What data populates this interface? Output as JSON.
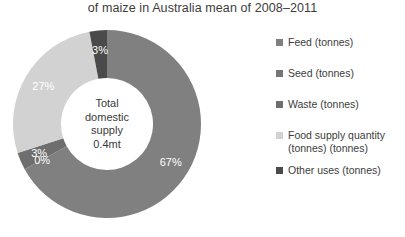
{
  "chart_data": {
    "type": "pie",
    "variant": "donut",
    "title": "of maize in Australia mean of 2008–2011",
    "categories": [
      "Feed (tonnes)",
      "Seed (tonnes)",
      "Waste (tonnes)",
      "Food supply quantity (tonnes) (tonnes)",
      "Other uses (tonnes)"
    ],
    "values": [
      67,
      0,
      3,
      27,
      3
    ],
    "data_labels": [
      "67%",
      "0%",
      "3%",
      "27%",
      "3%"
    ],
    "colors": [
      "#808080",
      "#757575",
      "#6e6e6e",
      "#d2d2d2",
      "#4a4a4a"
    ],
    "center_label": {
      "line1": "Total",
      "line2": "domestic",
      "line3": "supply",
      "line4": "0.4mt"
    },
    "legend_position": "right",
    "grid": false,
    "xlabel": "",
    "ylabel": ""
  },
  "legend": {
    "items": [
      {
        "label": "Feed (tonnes)",
        "label_line2": "",
        "color": "#808080"
      },
      {
        "label": "Seed (tonnes)",
        "label_line2": "",
        "color": "#757575"
      },
      {
        "label": "Waste (tonnes)",
        "label_line2": "",
        "color": "#6e6e6e"
      },
      {
        "label": "Food supply quantity",
        "label_line2": "(tonnes) (tonnes)",
        "color": "#d2d2d2"
      },
      {
        "label": "Other uses (tonnes)",
        "label_line2": "",
        "color": "#4a4a4a"
      }
    ]
  }
}
